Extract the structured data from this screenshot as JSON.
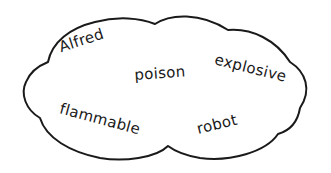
{
  "diagram": {
    "type": "word-cloud",
    "shape": "cloud",
    "stroke_color": "#1a1a1a",
    "background": "#ffffff",
    "words": [
      {
        "id": "alfred",
        "text": "Alfred",
        "x": 62,
        "y": 40,
        "rotate": -18
      },
      {
        "id": "poison",
        "text": "poison",
        "x": 135,
        "y": 68,
        "rotate": -4
      },
      {
        "id": "explosive",
        "text": "explosive",
        "x": 213,
        "y": 52,
        "rotate": 14
      },
      {
        "id": "flammable",
        "text": "flammable",
        "x": 58,
        "y": 101,
        "rotate": 15
      },
      {
        "id": "robot",
        "text": "robot",
        "x": 199,
        "y": 122,
        "rotate": -14
      }
    ]
  }
}
